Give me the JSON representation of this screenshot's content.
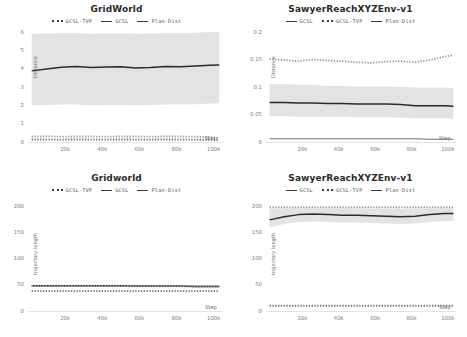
{
  "figure": {
    "layout": "2x2 grid of line plots",
    "colors": {
      "gcsl": "#2b2b2b",
      "gcsl_tvp": "#9a9a9a",
      "plan_dist": "#6f6f6f",
      "band": "#d9d9d9",
      "text": "#5a5a5a"
    }
  },
  "chart_data": [
    {
      "type": "line",
      "panel": "top-left",
      "title": "GridWorld",
      "xlabel": "Step",
      "ylabel": "Distance",
      "xlim": [
        0,
        105000
      ],
      "ylim": [
        0,
        6
      ],
      "xticks": [
        20000,
        40000,
        60000,
        80000,
        100000
      ],
      "xticklabels": [
        "20k",
        "40k",
        "60k",
        "80k",
        "100k"
      ],
      "yticks": [
        0,
        1,
        2,
        3,
        4,
        5,
        6
      ],
      "yticklabels": [
        "0",
        "1",
        "2",
        "3",
        "4",
        "5",
        "6"
      ],
      "grid": false,
      "legend": [
        "GCSL-TVP",
        "GCSL",
        "Plan-Dist"
      ],
      "legend_position": "above-axes-center",
      "x": [
        2000,
        10000,
        18000,
        26000,
        34000,
        42000,
        50000,
        58000,
        66000,
        74000,
        82000,
        90000,
        98000,
        103000
      ],
      "series": [
        {
          "name": "GCSL",
          "style": "solid",
          "values": [
            3.88,
            3.98,
            4.08,
            4.12,
            4.07,
            4.09,
            4.1,
            4.04,
            4.07,
            4.12,
            4.11,
            4.14,
            4.18,
            4.2
          ],
          "band_low": [
            2.0,
            2.02,
            2.05,
            2.05,
            2.0,
            2.02,
            2.03,
            2.0,
            2.02,
            2.05,
            2.04,
            2.06,
            2.1,
            2.12
          ],
          "band_high": [
            5.9,
            5.92,
            5.95,
            5.95,
            5.9,
            5.92,
            5.93,
            5.9,
            5.92,
            5.95,
            5.94,
            5.96,
            6.0,
            6.0
          ]
        },
        {
          "name": "GCSL-TVP",
          "style": "dotted",
          "values": [
            0.3,
            0.3,
            0.29,
            0.3,
            0.3,
            0.29,
            0.3,
            0.3,
            0.29,
            0.3,
            0.3,
            0.29,
            0.26,
            0.22
          ]
        },
        {
          "name": "Plan-Dist",
          "style": "dotted",
          "values": [
            0.14,
            0.13,
            0.13,
            0.14,
            0.13,
            0.13,
            0.14,
            0.13,
            0.13,
            0.14,
            0.13,
            0.13,
            0.12,
            0.1
          ]
        }
      ]
    },
    {
      "type": "line",
      "panel": "top-right",
      "title": "SawyerReachXYZEnv-v1",
      "xlabel": "Step",
      "ylabel": "Distance",
      "xlim": [
        0,
        105000
      ],
      "ylim": [
        0,
        0.2
      ],
      "xticks": [
        20000,
        40000,
        60000,
        80000,
        100000
      ],
      "xticklabels": [
        "20k",
        "40k",
        "60k",
        "80k",
        "100k"
      ],
      "yticks": [
        0,
        0.05,
        0.1,
        0.15,
        0.2
      ],
      "yticklabels": [
        "0",
        "0.05",
        "0.1",
        "0.15",
        "0.2"
      ],
      "grid": false,
      "legend": [
        "GCSL",
        "GCSL-TVP",
        "Plan-Dist"
      ],
      "legend_position": "above-axes-center",
      "x": [
        2000,
        10000,
        18000,
        26000,
        34000,
        42000,
        50000,
        58000,
        66000,
        74000,
        82000,
        90000,
        98000,
        103000
      ],
      "series": [
        {
          "name": "GCSL-TVP",
          "style": "dotted",
          "values": [
            0.151,
            0.149,
            0.147,
            0.15,
            0.148,
            0.147,
            0.145,
            0.144,
            0.146,
            0.147,
            0.145,
            0.149,
            0.155,
            0.158
          ]
        },
        {
          "name": "GCSL",
          "style": "solid",
          "values": [
            0.072,
            0.072,
            0.071,
            0.071,
            0.07,
            0.07,
            0.069,
            0.069,
            0.069,
            0.068,
            0.066,
            0.066,
            0.066,
            0.065
          ],
          "band_low": [
            0.047,
            0.047,
            0.046,
            0.046,
            0.046,
            0.046,
            0.045,
            0.045,
            0.045,
            0.044,
            0.043,
            0.043,
            0.043,
            0.042
          ],
          "band_high": [
            0.105,
            0.105,
            0.104,
            0.104,
            0.102,
            0.102,
            0.101,
            0.101,
            0.101,
            0.1,
            0.099,
            0.099,
            0.099,
            0.098
          ]
        },
        {
          "name": "Plan-Dist",
          "style": "solid",
          "values": [
            0.006,
            0.006,
            0.006,
            0.006,
            0.006,
            0.006,
            0.006,
            0.006,
            0.006,
            0.006,
            0.006,
            0.005,
            0.005,
            0.005
          ]
        }
      ]
    },
    {
      "type": "line",
      "panel": "bottom-left",
      "title": "Gridworld",
      "xlabel": "Step",
      "ylabel": "trajectory length",
      "xlim": [
        0,
        105000
      ],
      "ylim": [
        0,
        210
      ],
      "xticks": [
        20000,
        40000,
        60000,
        80000,
        100000
      ],
      "xticklabels": [
        "20k",
        "40k",
        "60k",
        "80k",
        "100k"
      ],
      "yticks": [
        0,
        50,
        100,
        150,
        200
      ],
      "yticklabels": [
        "0",
        "50",
        "100",
        "150",
        "200"
      ],
      "grid": false,
      "legend": [
        "GCSL-TVP",
        "GCSL",
        "Plan-Dist"
      ],
      "legend_position": "above-axes-center",
      "x": [
        2000,
        10000,
        18000,
        26000,
        34000,
        42000,
        50000,
        58000,
        66000,
        74000,
        82000,
        90000,
        98000,
        103000
      ],
      "series": [
        {
          "name": "GCSL",
          "style": "solid",
          "values": [
            48,
            48,
            48,
            48,
            48,
            48,
            48,
            47.5,
            47.5,
            47.5,
            47.5,
            47,
            47,
            47
          ],
          "band_low": [
            46,
            46,
            46,
            46,
            46,
            46,
            46,
            45.5,
            45.5,
            45.5,
            45.5,
            45,
            45,
            45
          ],
          "band_high": [
            50,
            50,
            50,
            50,
            50,
            50,
            50,
            49.5,
            49.5,
            49.5,
            49.5,
            49,
            49,
            49
          ]
        },
        {
          "name": "GCSL-TVP",
          "style": "dotted",
          "values": [
            48,
            48,
            48,
            48,
            48,
            48,
            48,
            47.5,
            47.5,
            47.5,
            47.5,
            47,
            47,
            47
          ]
        },
        {
          "name": "Plan-Dist",
          "style": "dotted",
          "values": [
            38,
            38,
            38,
            38,
            38,
            38,
            38,
            38,
            38,
            38,
            38,
            38,
            38,
            38
          ]
        }
      ]
    },
    {
      "type": "line",
      "panel": "bottom-right",
      "title": "SawyerReachXYZEnv-v1",
      "xlabel": "Step",
      "ylabel": "trajectory length",
      "xlim": [
        0,
        105000
      ],
      "ylim": [
        0,
        210
      ],
      "xticks": [
        20000,
        40000,
        60000,
        80000,
        100000
      ],
      "xticklabels": [
        "20k",
        "40k",
        "60k",
        "80k",
        "100k"
      ],
      "yticks": [
        0,
        50,
        100,
        150,
        200
      ],
      "yticklabels": [
        "0",
        "50",
        "100",
        "150",
        "200"
      ],
      "grid": false,
      "legend": [
        "GCSL",
        "GCSL-TVP",
        "Plan-Dist"
      ],
      "legend_position": "above-axes-center",
      "x": [
        2000,
        10000,
        18000,
        26000,
        34000,
        42000,
        50000,
        58000,
        66000,
        74000,
        82000,
        90000,
        98000,
        103000
      ],
      "series": [
        {
          "name": "GCSL-TVP",
          "style": "dotted",
          "values": [
            198,
            198,
            198,
            198,
            198,
            198,
            198,
            198,
            198,
            198,
            198,
            198,
            198,
            198
          ]
        },
        {
          "name": "GCSL",
          "style": "solid",
          "values": [
            174,
            180,
            184,
            185,
            184,
            183,
            183,
            182,
            181,
            180,
            181,
            184,
            186,
            186
          ],
          "band_low": [
            160,
            166,
            170,
            171,
            170,
            169,
            169,
            168,
            167,
            166,
            167,
            170,
            172,
            172
          ],
          "band_high": [
            195,
            196,
            196,
            196,
            196,
            196,
            196,
            195,
            195,
            195,
            195,
            196,
            196,
            196
          ]
        },
        {
          "name": "Plan-Dist",
          "style": "dotted",
          "values": [
            10,
            10,
            10,
            10,
            10,
            10,
            10,
            10,
            10,
            10,
            10,
            10,
            10,
            10
          ]
        }
      ]
    }
  ]
}
